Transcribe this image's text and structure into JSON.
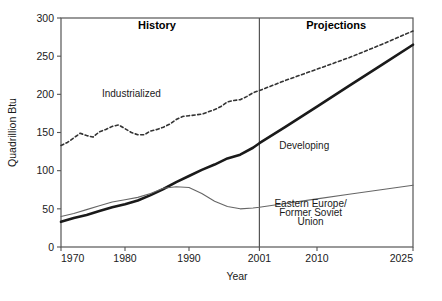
{
  "chart_data": {
    "type": "line",
    "title": "",
    "xlabel": "Year",
    "ylabel": "Quadrillion Btu",
    "xlim": [
      1970,
      2025
    ],
    "ylim": [
      0,
      300
    ],
    "xticks": [
      1970,
      1980,
      1990,
      2001,
      2010,
      2025
    ],
    "xticklabels": [
      "1970",
      "1980",
      "1990",
      "2001",
      "2010",
      "2025"
    ],
    "yticks": [
      0,
      50,
      100,
      150,
      200,
      250,
      300
    ],
    "yticklabels": [
      "0",
      "50",
      "100",
      "150",
      "200",
      "250",
      "300"
    ],
    "grid": false,
    "legend_position": "inline-annotations",
    "history_projection_divider": 2001,
    "annotations": [
      {
        "text": "History",
        "x": 1985,
        "y": 285,
        "bold": true
      },
      {
        "text": "Projections",
        "x": 2013,
        "y": 285,
        "bold": true
      },
      {
        "text": "Industrialized",
        "x": 1981,
        "y": 196,
        "bold": false
      },
      {
        "text": "Developing",
        "x": 2008,
        "y": 128,
        "bold": false
      },
      {
        "text": "Eastern Europe/",
        "x": 2009,
        "y": 53,
        "bold": false
      },
      {
        "text": "Former Soviet",
        "x": 2009,
        "y": 41,
        "bold": false
      },
      {
        "text": "Union",
        "x": 2009,
        "y": 29,
        "bold": false
      }
    ],
    "series": [
      {
        "name": "Industrialized",
        "style": "dashed",
        "color": "#333333",
        "x": [
          1970,
          1971,
          1972,
          1973,
          1974,
          1975,
          1976,
          1977,
          1978,
          1979,
          1980,
          1981,
          1982,
          1983,
          1984,
          1985,
          1986,
          1987,
          1988,
          1989,
          1990,
          1991,
          1992,
          1993,
          1994,
          1995,
          1996,
          1997,
          1998,
          1999,
          2000,
          2001,
          2005,
          2010,
          2015,
          2020,
          2025
        ],
        "values": [
          133,
          137,
          143,
          149,
          146,
          144,
          151,
          154,
          158,
          160,
          155,
          150,
          147,
          147,
          152,
          154,
          157,
          161,
          167,
          171,
          172,
          173,
          174,
          177,
          180,
          184,
          190,
          192,
          193,
          197,
          202,
          205,
          218,
          233,
          248,
          265,
          283
        ]
      },
      {
        "name": "Developing",
        "style": "solid-thick",
        "color": "#1a1a1a",
        "x": [
          1970,
          1972,
          1974,
          1976,
          1978,
          1980,
          1982,
          1984,
          1986,
          1988,
          1990,
          1992,
          1994,
          1996,
          1998,
          2000,
          2001,
          2005,
          2010,
          2015,
          2020,
          2025
        ],
        "values": [
          33,
          38,
          42,
          47,
          52,
          56,
          61,
          68,
          76,
          85,
          93,
          101,
          108,
          116,
          121,
          130,
          136,
          157,
          184,
          211,
          238,
          265
        ]
      },
      {
        "name": "Eastern Europe/Former Soviet Union",
        "style": "solid-thin",
        "color": "#666666",
        "x": [
          1970,
          1972,
          1974,
          1976,
          1978,
          1980,
          1982,
          1984,
          1986,
          1988,
          1990,
          1992,
          1994,
          1996,
          1998,
          2000,
          2001,
          2005,
          2010,
          2015,
          2020,
          2025
        ],
        "values": [
          40,
          44,
          49,
          54,
          59,
          62,
          65,
          70,
          77,
          79,
          78,
          70,
          60,
          53,
          50,
          51,
          52,
          57,
          63,
          69,
          75,
          81
        ]
      }
    ]
  }
}
